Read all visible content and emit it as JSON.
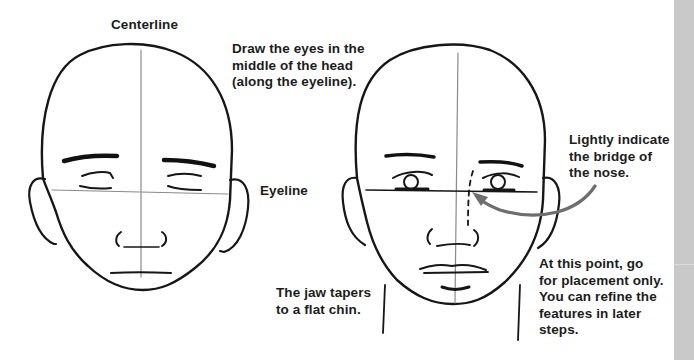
{
  "figure": {
    "accent_color": "#6e6e6e",
    "ink_color": "#161616",
    "side_strip_color": "#c9c9c9"
  },
  "labels": {
    "centerline": "Centerline",
    "eyes_middle": "Draw the eyes in the\nmiddle of the head\n(along the eyeline).",
    "eyeline": "Eyeline",
    "jaw": "The jaw tapers\nto a flat chin.",
    "bridge": "Lightly indicate\nthe bridge of\nthe nose.",
    "placement": "At this point, go\nfor placement only.\nYou can refine the\nfeatures in later\nsteps."
  },
  "drawings": [
    {
      "name": "head-closed-eyes",
      "features": [
        "centerline",
        "eyeline",
        "eyebrows",
        "closed-eyes",
        "nose",
        "mouth-line",
        "ears"
      ]
    },
    {
      "name": "head-open-eyes",
      "features": [
        "centerline",
        "eyeline",
        "eyebrows",
        "open-eyes",
        "nose-bridge-dashed",
        "nose",
        "lips",
        "neck",
        "ears"
      ]
    }
  ],
  "annotations": [
    {
      "name": "bridge-arrow",
      "color": "#6e6e6e",
      "points_to": "nose bridge"
    }
  ]
}
